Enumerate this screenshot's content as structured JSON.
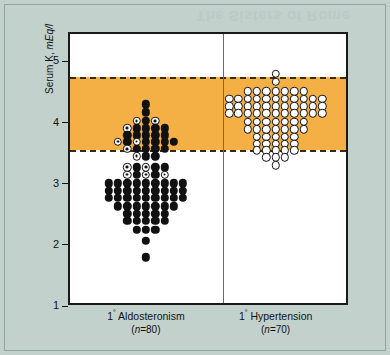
{
  "figure": {
    "background_color": "#c3d1cd",
    "panel_color": "#ffffff",
    "bleed_text": "The Sisters of Rome"
  },
  "chart_data": {
    "type": "scatter",
    "title": "",
    "subtitle": "",
    "xlabel": "",
    "ylabel": "Serum K, mEq/l",
    "ylabel_main": "Serum K, ",
    "ylabel_units": "mEq/l",
    "ylim": [
      1,
      5.4
    ],
    "yticks": [
      1,
      2,
      3,
      4,
      5
    ],
    "ytick_labels": [
      "1",
      "2",
      "3",
      "4",
      "5"
    ],
    "grid": false,
    "legend": "none",
    "reference_band": {
      "label": "normal reference range",
      "lower": 3.5,
      "upper": 4.7,
      "color": "#f5b045",
      "edge_style": "dashed",
      "edge_color": "#3a2a08"
    },
    "groups": [
      {
        "name": "1° Aldosteronism",
        "name_prefix": "1",
        "name_degree": "°",
        "name_text": " Aldosteronism",
        "n_label": "(n=80)",
        "n_prefix": "(",
        "n_italic": "n",
        "n_value": "=80)",
        "n": 80,
        "marker": "filled-circle",
        "marker_color": "#111111",
        "min": 1.75,
        "max": 4.25,
        "median": 2.8,
        "stack_values": [
          {
            "y": 4.25,
            "count": 1,
            "special": 0
          },
          {
            "y": 4.12,
            "count": 1,
            "special": 0
          },
          {
            "y": 3.98,
            "count": 3,
            "special": 2
          },
          {
            "y": 3.86,
            "count": 5,
            "special": 1
          },
          {
            "y": 3.74,
            "count": 5,
            "special": 0
          },
          {
            "y": 3.64,
            "count": 7,
            "special": 2
          },
          {
            "y": 3.52,
            "count": 5,
            "special": 1
          },
          {
            "y": 3.4,
            "count": 3,
            "special": 1
          },
          {
            "y": 3.22,
            "count": 5,
            "special": 2
          },
          {
            "y": 3.1,
            "count": 5,
            "special": 3
          },
          {
            "y": 2.96,
            "count": 9,
            "special": 0
          },
          {
            "y": 2.84,
            "count": 9,
            "special": 0
          },
          {
            "y": 2.72,
            "count": 9,
            "special": 0
          },
          {
            "y": 2.58,
            "count": 7,
            "special": 0
          },
          {
            "y": 2.46,
            "count": 5,
            "special": 0
          },
          {
            "y": 2.34,
            "count": 5,
            "special": 0
          },
          {
            "y": 2.2,
            "count": 3,
            "special": 0
          },
          {
            "y": 2.02,
            "count": 1,
            "special": 0
          },
          {
            "y": 1.75,
            "count": 1,
            "special": 0
          }
        ]
      },
      {
        "name": "1° Hypertension",
        "name_prefix": "1",
        "name_degree": "°",
        "name_text": " Hypertension",
        "n_label": "(n=70)",
        "n_prefix": "(",
        "n_italic": "n",
        "n_value": "=70)",
        "n": 70,
        "marker": "open-circle",
        "marker_color": "#ffffff",
        "marker_edge_color": "#111111",
        "min": 3.25,
        "max": 4.75,
        "median": 4.2,
        "stack_values": [
          {
            "y": 4.75,
            "count": 1,
            "special": 0
          },
          {
            "y": 4.62,
            "count": 1,
            "special": 0
          },
          {
            "y": 4.46,
            "count": 7,
            "special": 0
          },
          {
            "y": 4.34,
            "count": 11,
            "special": 0
          },
          {
            "y": 4.22,
            "count": 11,
            "special": 0
          },
          {
            "y": 4.1,
            "count": 11,
            "special": 0
          },
          {
            "y": 3.96,
            "count": 7,
            "special": 0
          },
          {
            "y": 3.84,
            "count": 7,
            "special": 0
          },
          {
            "y": 3.72,
            "count": 5,
            "special": 0
          },
          {
            "y": 3.6,
            "count": 5,
            "special": 0
          },
          {
            "y": 3.5,
            "count": 5,
            "special": 0
          },
          {
            "y": 3.38,
            "count": 3,
            "special": 0
          },
          {
            "y": 3.25,
            "count": 1,
            "special": 0
          }
        ]
      }
    ],
    "marker_notes": {
      "bullseye": "filled marker with white ring and dark center"
    }
  }
}
